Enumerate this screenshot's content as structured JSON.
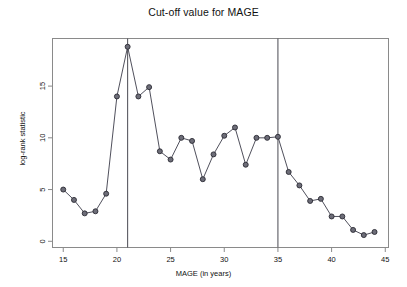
{
  "chart_data": {
    "type": "line",
    "title": "Cut-off value for MAGE",
    "xlabel": "MAGE (in years)",
    "ylabel": "log-rank statistic",
    "xlim": [
      14.0,
      45.3
    ],
    "ylim": [
      -0.6,
      19.6
    ],
    "xticks": [
      15,
      20,
      25,
      30,
      35,
      40,
      45
    ],
    "yticks": [
      0,
      5,
      10,
      15
    ],
    "xtick_labels": [
      "15",
      "20",
      "25",
      "30",
      "35",
      "40",
      "45"
    ],
    "ytick_labels": [
      "0",
      "5",
      "10",
      "15"
    ],
    "grid": false,
    "legend": "none",
    "marker": "open-circle",
    "line_color": "#3c3c4a",
    "marker_fill": "#6d6d78",
    "marker_edge": "#2a2a33",
    "frame_color": "#8a8a8a",
    "x": [
      15,
      16,
      17,
      18,
      19,
      20,
      21,
      22,
      23,
      24,
      25,
      26,
      27,
      28,
      29,
      30,
      31,
      32,
      33,
      34,
      35,
      36,
      37,
      38,
      39,
      40,
      41,
      42,
      43,
      44
    ],
    "values": [
      5.0,
      4.0,
      2.7,
      2.9,
      4.6,
      14.0,
      18.8,
      14.0,
      14.9,
      8.7,
      7.9,
      10.0,
      9.7,
      6.0,
      8.4,
      10.2,
      11.0,
      7.4,
      10.0,
      10.0,
      10.1,
      6.7,
      5.4,
      3.9,
      4.1,
      2.4,
      2.4,
      1.1,
      0.6,
      0.9
    ],
    "vertical_reference_lines": [
      {
        "x": 21,
        "label": "cutoff-21"
      },
      {
        "x": 35,
        "label": "cutoff-35"
      }
    ]
  }
}
